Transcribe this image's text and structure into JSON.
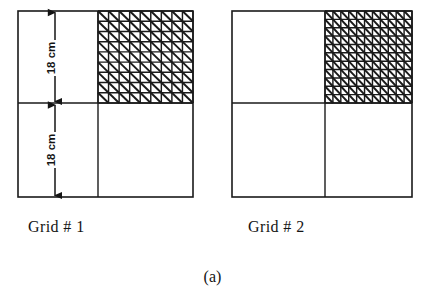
{
  "figure": {
    "caption": "(a)",
    "background_color": "#ffffff",
    "line_color": "#1a1a1a"
  },
  "dimensions": [
    {
      "id": "upper",
      "label": "18 cm"
    },
    {
      "id": "lower",
      "label": "18 cm"
    }
  ],
  "grids": [
    {
      "id": "grid-1",
      "label": "Grid # 1",
      "mesh_divisions": 9,
      "mesh_quadrant": "upper-right",
      "quadrants": [
        "upper-left",
        "upper-right",
        "lower-left",
        "lower-right"
      ],
      "outline": {
        "x": 18,
        "y": 11,
        "width": 175,
        "height": 186
      },
      "divider_x": 98,
      "divider_y": 103
    },
    {
      "id": "grid-2",
      "label": "Grid # 2",
      "mesh_divisions": 11,
      "mesh_quadrant": "upper-right",
      "quadrants": [
        "upper-left",
        "upper-right",
        "lower-left",
        "lower-right"
      ],
      "outline": {
        "x": 232,
        "y": 11,
        "width": 180,
        "height": 186
      },
      "divider_x": 325,
      "divider_y": 103
    }
  ],
  "chart_data": {
    "type": "diagram",
    "title": "(a)",
    "items": [
      {
        "name": "Grid # 1",
        "mesh_divisions": 9,
        "meshed_quadrant": "upper-right",
        "half_height_label": "18 cm",
        "half_width_label": "18 cm"
      },
      {
        "name": "Grid # 2",
        "mesh_divisions": 11,
        "meshed_quadrant": "upper-right",
        "half_height_label": "18 cm",
        "half_width_label": "18 cm"
      }
    ]
  }
}
